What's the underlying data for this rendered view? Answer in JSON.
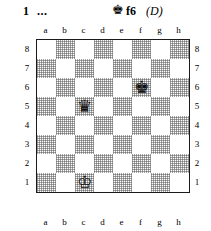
{
  "header": {
    "move_number": "1",
    "ellipsis": "...",
    "piece_icon": "♚",
    "piece_icon_name": "king-icon",
    "square": "f6",
    "tag": "(D)"
  },
  "board": {
    "files": [
      "a",
      "b",
      "c",
      "d",
      "e",
      "f",
      "g",
      "h"
    ],
    "ranks": [
      "8",
      "7",
      "6",
      "5",
      "4",
      "3",
      "2",
      "1"
    ],
    "light_color": "#ffffff",
    "dark_color": "#bdbdbd",
    "border_color": "#1a1a1a",
    "pieces": [
      {
        "square": "f6",
        "file": "f",
        "rank": "6",
        "type": "king",
        "color": "black",
        "glyph": "♚"
      },
      {
        "square": "c5",
        "file": "c",
        "rank": "5",
        "type": "queen",
        "color": "black",
        "glyph": "♛"
      },
      {
        "square": "c1",
        "file": "c",
        "rank": "1",
        "type": "king",
        "color": "white",
        "glyph": "♔"
      }
    ]
  }
}
